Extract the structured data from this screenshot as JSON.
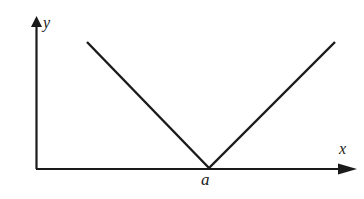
{
  "figure": {
    "background_color": "#ffffff",
    "stroke_color": "#1a1a1a"
  },
  "axes": {
    "x": {
      "label": "x",
      "origin_px": [
        36,
        169
      ],
      "end_px": [
        356,
        169
      ],
      "arrow": true
    },
    "y": {
      "label": "y",
      "origin_px": [
        36,
        169
      ],
      "end_px": [
        36,
        17
      ],
      "arrow": true
    }
  },
  "annotations": {
    "vertex_label": "a"
  },
  "chart_data": {
    "type": "line",
    "title": "",
    "xlabel": "x",
    "ylabel": "y",
    "grid": false,
    "legend": null,
    "axis_arrows": true,
    "tick_labels": {
      "x": [
        "a"
      ],
      "y": []
    },
    "series": [
      {
        "name": "V-shaped curve",
        "points_px": [
          [
            87,
            42
          ],
          [
            209,
            168
          ],
          [
            335,
            42
          ]
        ],
        "color": "#1a1a1a",
        "linewidth": 2.4
      }
    ],
    "annotations": [
      {
        "text": "a",
        "type": "x-axis-tick-label",
        "at_px": [
          209,
          180
        ]
      }
    ]
  }
}
